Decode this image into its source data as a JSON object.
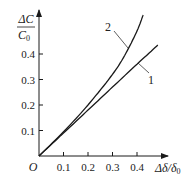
{
  "chart_data": {
    "type": "line",
    "title": "",
    "xlabel": "Δδ/δ0",
    "ylabel": "ΔC/C0",
    "xlim": [
      0,
      0.5
    ],
    "ylim": [
      0,
      0.57
    ],
    "x_ticks": [
      "0.1",
      "0.2",
      "0.3",
      "0.4"
    ],
    "y_ticks": [
      "0.1",
      "0.2",
      "0.3",
      "0.4"
    ],
    "origin_label": "O",
    "grid": false,
    "legend": "inline curve labels",
    "series": [
      {
        "name": "1",
        "x": [
          0,
          0.1,
          0.2,
          0.3,
          0.4,
          0.485
        ],
        "y": [
          0,
          0.09,
          0.18,
          0.27,
          0.36,
          0.435
        ]
      },
      {
        "name": "2",
        "x": [
          0,
          0.1,
          0.2,
          0.3,
          0.35,
          0.4,
          0.425
        ],
        "y": [
          0,
          0.095,
          0.2,
          0.32,
          0.395,
          0.49,
          0.553
        ]
      }
    ]
  },
  "axes": {
    "y_label_num": "ΔC",
    "y_label_den": "C",
    "y_label_den_sub": "0",
    "x_label_main": "Δδ/δ",
    "x_label_sub": "0",
    "origin": "O"
  },
  "labels": {
    "curve1": "1",
    "curve2": "2"
  },
  "colors": {
    "line": "#1a1a1a",
    "text": "#222222"
  }
}
